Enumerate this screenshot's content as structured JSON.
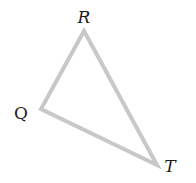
{
  "diagram": {
    "type": "triangle",
    "vertices": [
      {
        "label": "R",
        "x": 84,
        "y": 31,
        "label_x": 84,
        "label_y": 23
      },
      {
        "label": "Q",
        "x": 41,
        "y": 109,
        "label_x": 21,
        "label_y": 119
      },
      {
        "label": "T",
        "x": 157,
        "y": 165,
        "label_x": 170,
        "label_y": 172
      }
    ],
    "stroke_color": "#c8c8c8"
  }
}
